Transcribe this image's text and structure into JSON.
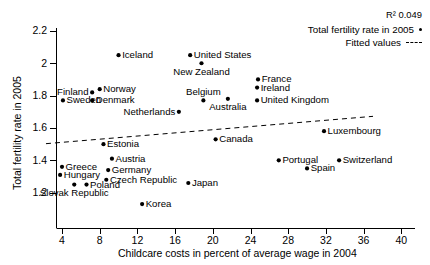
{
  "chart_data": {
    "type": "scatter",
    "title": "",
    "xlabel": "Childcare costs in percent of average wage in 2004",
    "ylabel": "Total fertility rate in 2005",
    "xlim": [
      2.2,
      41
    ],
    "ylim": [
      1.06,
      2.27
    ],
    "xticks": [
      4,
      8,
      12,
      16,
      20,
      24,
      28,
      32,
      36,
      40
    ],
    "yticks": [
      "1.2",
      "1.4",
      "1.6",
      "1.8",
      "2",
      "2.2"
    ],
    "grid": false,
    "legend_position": "top-right",
    "annotations": {
      "r_squared": "R² 0.049"
    },
    "legend": [
      {
        "label": "Total fertility rate in 2005",
        "marker": "dot"
      },
      {
        "label": "Fitted values",
        "marker": "dashed-line"
      }
    ],
    "fitted_line": {
      "x_start": 2.3,
      "y_start": 1.503,
      "x_end": 37.0,
      "y_end": 1.672
    },
    "points": [
      {
        "label": "Iceland",
        "x": 10.0,
        "y": 2.05,
        "label_pos": "right"
      },
      {
        "label": "United States",
        "x": 17.6,
        "y": 2.05,
        "label_pos": "right"
      },
      {
        "label": "New Zealand",
        "x": 18.8,
        "y": 2.0,
        "label_pos": "below"
      },
      {
        "label": "France",
        "x": 24.8,
        "y": 1.9,
        "label_pos": "right"
      },
      {
        "label": "Ireland",
        "x": 24.7,
        "y": 1.85,
        "label_pos": "right"
      },
      {
        "label": "Norway",
        "x": 8.0,
        "y": 1.84,
        "label_pos": "right"
      },
      {
        "label": "Finland",
        "x": 7.2,
        "y": 1.82,
        "label_pos": "left"
      },
      {
        "label": "Belgium",
        "x": 19.0,
        "y": 1.77,
        "label_pos": "above"
      },
      {
        "label": "Sweden",
        "x": 4.1,
        "y": 1.77,
        "label_pos": "right"
      },
      {
        "label": "Denmark",
        "x": 7.2,
        "y": 1.77,
        "label_pos": "right"
      },
      {
        "label": "Australia",
        "x": 21.6,
        "y": 1.78,
        "label_pos": "below"
      },
      {
        "label": "United Kingdom",
        "x": 24.7,
        "y": 1.77,
        "label_pos": "right"
      },
      {
        "label": "Netherlands",
        "x": 16.4,
        "y": 1.7,
        "label_pos": "left"
      },
      {
        "label": "Luxembourg",
        "x": 31.8,
        "y": 1.58,
        "label_pos": "right"
      },
      {
        "label": "Estonia",
        "x": 8.4,
        "y": 1.5,
        "label_pos": "right"
      },
      {
        "label": "Canada",
        "x": 20.3,
        "y": 1.53,
        "label_pos": "right"
      },
      {
        "label": "Austria",
        "x": 9.3,
        "y": 1.41,
        "label_pos": "right"
      },
      {
        "label": "Portugal",
        "x": 27.0,
        "y": 1.4,
        "label_pos": "right"
      },
      {
        "label": "Switzerland",
        "x": 33.4,
        "y": 1.4,
        "label_pos": "right"
      },
      {
        "label": "Greece",
        "x": 4.0,
        "y": 1.36,
        "label_pos": "right"
      },
      {
        "label": "Germany",
        "x": 8.9,
        "y": 1.34,
        "label_pos": "right"
      },
      {
        "label": "Hungary",
        "x": 3.8,
        "y": 1.31,
        "label_pos": "right"
      },
      {
        "label": "Czech Republic",
        "x": 8.7,
        "y": 1.28,
        "label_pos": "right"
      },
      {
        "label": "Spain",
        "x": 30.0,
        "y": 1.35,
        "label_pos": "right"
      },
      {
        "label": "Japan",
        "x": 17.4,
        "y": 1.26,
        "label_pos": "right"
      },
      {
        "label": "Slovak Republic",
        "x": 5.3,
        "y": 1.25,
        "label_pos": "below"
      },
      {
        "label": "Poland",
        "x": 6.6,
        "y": 1.25,
        "label_pos": "right"
      },
      {
        "label": "Korea",
        "x": 12.5,
        "y": 1.13,
        "label_pos": "right"
      }
    ]
  }
}
